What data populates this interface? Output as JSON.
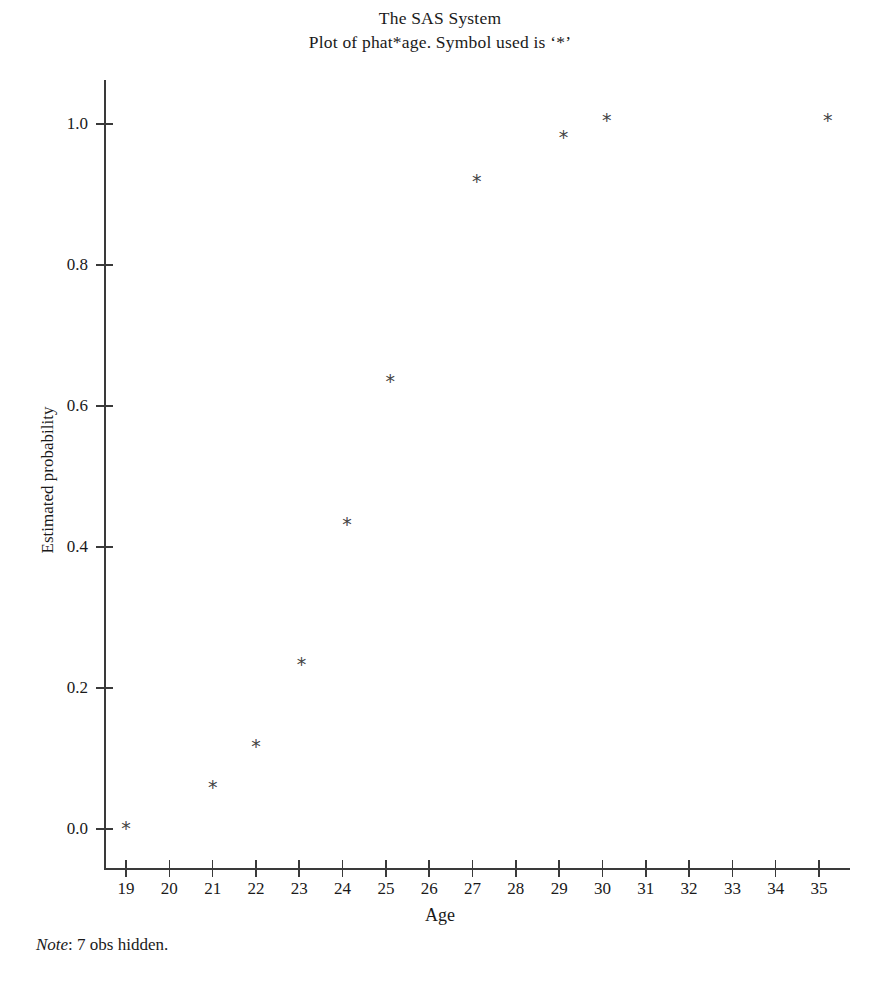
{
  "title": {
    "line1": "The SAS System",
    "line2": "Plot of phat*age. Symbol used is ‘*’"
  },
  "footnote": {
    "prefix": "Note",
    "separator": ": ",
    "text": "7 obs hidden."
  },
  "chart_data": {
    "type": "scatter",
    "title": "The SAS System",
    "subtitle": "Plot of phat*age. Symbol used is ‘*’",
    "xlabel": "Age",
    "ylabel": "Estimated probability",
    "marker": "*",
    "marker_color": "#444444",
    "axis_color": "#3a3a3a",
    "grid": false,
    "legend": false,
    "xlim": [
      18.6,
      35.8
    ],
    "ylim": [
      -0.03,
      1.06
    ],
    "xticks": [
      19,
      20,
      21,
      22,
      23,
      24,
      25,
      26,
      27,
      28,
      29,
      30,
      31,
      32,
      33,
      34,
      35
    ],
    "xticklabels": [
      "19",
      "20",
      "21",
      "22",
      "23",
      "24",
      "25",
      "26",
      "27",
      "28",
      "29",
      "30",
      "31",
      "32",
      "33",
      "34",
      "35"
    ],
    "yticks": [
      0.0,
      0.2,
      0.4,
      0.6,
      0.8,
      1.0
    ],
    "yticklabels": [
      "0.0",
      "0.2",
      "0.4",
      "0.6",
      "0.8",
      "1.0"
    ],
    "x": [
      19.0,
      21.0,
      22.0,
      23.05,
      24.1,
      25.1,
      27.1,
      29.1,
      30.1,
      35.2
    ],
    "y": [
      0.001,
      0.06,
      0.118,
      0.234,
      0.433,
      0.635,
      0.919,
      0.981,
      1.005,
      1.005
    ],
    "points": [
      {
        "age": 19.0,
        "phat": 0.001
      },
      {
        "age": 21.0,
        "phat": 0.06
      },
      {
        "age": 22.0,
        "phat": 0.118
      },
      {
        "age": 23.05,
        "phat": 0.234
      },
      {
        "age": 24.1,
        "phat": 0.433
      },
      {
        "age": 25.1,
        "phat": 0.635
      },
      {
        "age": 27.1,
        "phat": 0.919
      },
      {
        "age": 29.1,
        "phat": 0.981
      },
      {
        "age": 30.1,
        "phat": 1.005
      },
      {
        "age": 35.2,
        "phat": 1.005
      }
    ],
    "hidden_obs": 7,
    "note": "Note: 7 obs hidden."
  },
  "geometry": {
    "x_pixel_min": 126,
    "x_pixel_max": 819,
    "x_value_min": 19,
    "x_value_max": 35,
    "y_pixel_zero": 829,
    "y_pixel_one": 124
  }
}
